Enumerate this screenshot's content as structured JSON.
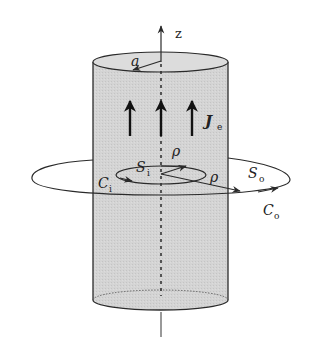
{
  "diagram": {
    "type": "cylindrical conductor with Ampere loops",
    "colors": {
      "cylinder_fill": "#d3d3d3",
      "stroke": "#2a2a2a",
      "background": "#ffffff"
    },
    "labels": {
      "axis": "z",
      "radius": "a",
      "current": "J",
      "current_sub": "e",
      "inner_surface": "S",
      "inner_surface_sub": "i",
      "inner_contour": "C",
      "inner_contour_sub": "i",
      "outer_surface": "S",
      "outer_surface_sub": "o",
      "outer_contour": "C",
      "outer_contour_sub": "o",
      "rho_inner": "ρ",
      "rho_outer": "ρ"
    },
    "elements": [
      "cylinder",
      "z-axis",
      "radius-arrow-a",
      "current-arrows-Je (3)",
      "inner-loop Ci with surface Si",
      "outer-loop Co with surface So",
      "radial vectors rho"
    ]
  }
}
